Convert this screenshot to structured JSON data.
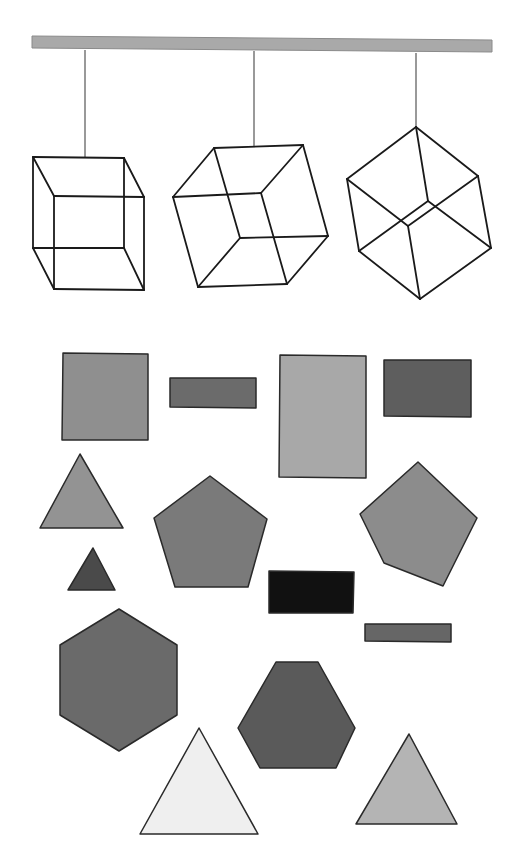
{
  "diagram": {
    "colors": {
      "background": "#ffffff",
      "bar": "#a9a9a9",
      "wire": "#1a1a1a",
      "string": "#555555"
    },
    "bar": {
      "x1": 32,
      "y1": 36,
      "x2": 492,
      "y2": 52
    },
    "cubes": [
      {
        "name": "cube-front-view",
        "string": [
          85,
          50,
          85,
          157
        ],
        "edges": [
          [
            33,
            157,
            124,
            158
          ],
          [
            124,
            158,
            144,
            197
          ],
          [
            144,
            197,
            144,
            290
          ],
          [
            144,
            290,
            54,
            289
          ],
          [
            54,
            289,
            33,
            248
          ],
          [
            33,
            248,
            33,
            157
          ],
          [
            33,
            157,
            54,
            196
          ],
          [
            54,
            196,
            144,
            197
          ],
          [
            54,
            196,
            54,
            289
          ],
          [
            124,
            158,
            124,
            248
          ],
          [
            124,
            248,
            33,
            248
          ],
          [
            124,
            248,
            144,
            290
          ]
        ]
      },
      {
        "name": "cube-rotated-view",
        "string": [
          254,
          51,
          254,
          146
        ],
        "edges": [
          [
            214,
            148,
            303,
            145
          ],
          [
            303,
            145,
            328,
            236
          ],
          [
            328,
            236,
            287,
            284
          ],
          [
            287,
            284,
            198,
            287
          ],
          [
            198,
            287,
            173,
            197
          ],
          [
            173,
            197,
            214,
            148
          ],
          [
            214,
            148,
            240,
            238
          ],
          [
            240,
            238,
            328,
            236
          ],
          [
            240,
            238,
            198,
            287
          ],
          [
            173,
            197,
            261,
            193
          ],
          [
            261,
            193,
            303,
            145
          ],
          [
            261,
            193,
            287,
            284
          ]
        ]
      },
      {
        "name": "cube-vertex-view",
        "string": [
          416,
          53,
          416,
          127
        ],
        "edges": [
          [
            416,
            127,
            478,
            176
          ],
          [
            478,
            176,
            491,
            248
          ],
          [
            491,
            248,
            420,
            299
          ],
          [
            420,
            299,
            359,
            251
          ],
          [
            359,
            251,
            347,
            179
          ],
          [
            347,
            179,
            416,
            127
          ],
          [
            416,
            127,
            428,
            201
          ],
          [
            428,
            201,
            491,
            248
          ],
          [
            428,
            201,
            359,
            251
          ],
          [
            347,
            179,
            408,
            226
          ],
          [
            408,
            226,
            478,
            176
          ],
          [
            408,
            226,
            420,
            299
          ]
        ]
      }
    ],
    "shapes": [
      {
        "name": "square-medium-gray",
        "type": "polygon",
        "fill": "#8f8f8f",
        "points": "63,353 148,354 148,440 62,440"
      },
      {
        "name": "rectangle-thin-dark-gray",
        "type": "polygon",
        "fill": "#6b6b6b",
        "points": "170,378 256,378 256,408 170,407"
      },
      {
        "name": "rectangle-tall-light-gray",
        "type": "polygon",
        "fill": "#a8a8a8",
        "points": "280,355 366,356 366,478 279,477"
      },
      {
        "name": "rectangle-dark-gray",
        "type": "polygon",
        "fill": "#5e5e5e",
        "points": "384,360 471,360 471,417 384,416"
      },
      {
        "name": "triangle-medium-gray",
        "type": "polygon",
        "fill": "#939393",
        "points": "80,454 123,528 40,528"
      },
      {
        "name": "pentagon-medium-gray",
        "type": "polygon",
        "fill": "#7a7a7a",
        "points": "210,476 267,519 248,587 175,587 154,518"
      },
      {
        "name": "pentagon-rotated-gray",
        "type": "polygon",
        "fill": "#8c8c8c",
        "points": "418,462 477,518 443,586 384,563 360,514"
      },
      {
        "name": "triangle-small-dark",
        "type": "polygon",
        "fill": "#4a4a4a",
        "points": "93,548 115,590 68,590"
      },
      {
        "name": "rectangle-black",
        "type": "polygon",
        "fill": "#111111",
        "points": "269,571 354,572 353,613 269,613"
      },
      {
        "name": "rectangle-thin-gray",
        "type": "polygon",
        "fill": "#666666",
        "points": "365,624 451,624 451,642 365,641"
      },
      {
        "name": "hexagon-large-dark",
        "type": "polygon",
        "fill": "#6a6a6a",
        "points": "119,609 177,645 177,715 119,751 60,715 60,645"
      },
      {
        "name": "hexagon-dark",
        "type": "polygon",
        "fill": "#5a5a5a",
        "points": "276,662 318,662 355,728 336,768 260,768 238,728"
      },
      {
        "name": "triangle-large-white",
        "type": "polygon",
        "fill": "#efefef",
        "points": "199,728 258,834 140,834"
      },
      {
        "name": "triangle-light-gray",
        "type": "polygon",
        "fill": "#b4b4b4",
        "points": "409,734 457,824 356,824"
      }
    ]
  }
}
